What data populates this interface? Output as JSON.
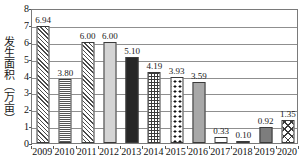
{
  "chart_data": {
    "type": "bar",
    "title": "",
    "xlabel": "",
    "ylabel": "发生面积（万亩）",
    "categories": [
      "2009",
      "2010",
      "2011",
      "2012",
      "2013",
      "2014",
      "2015",
      "2016",
      "2017",
      "2018",
      "2019",
      "2020"
    ],
    "values": [
      6.94,
      3.8,
      6.0,
      6.0,
      5.1,
      4.19,
      3.93,
      3.59,
      0.33,
      0.1,
      0.92,
      1.35
    ],
    "data_labels": [
      "6.94",
      "3.80",
      "6.00",
      "6.00",
      "5.10",
      "4.19",
      "3.93",
      "3.59",
      "0.33",
      "0.10",
      "0.92",
      "1.35"
    ],
    "bar_fills": [
      "diagonal-hatch",
      "horizontal-lines",
      "diagonal-hatch",
      "light-gray-solid",
      "black-solid",
      "fine-grid",
      "polka-dots",
      "mid-gray-solid",
      "white-empty",
      "black-solid",
      "dark-gray-solid",
      "cross-hatch-diamond"
    ],
    "ylim": [
      0,
      8
    ],
    "yticks": [
      "0",
      "1",
      "2",
      "3",
      "4",
      "5",
      "6",
      "7",
      "8"
    ],
    "ytick_values": [
      0,
      1,
      2,
      3,
      4,
      5,
      6,
      7,
      8
    ],
    "grid": "horizontal",
    "legend": "none",
    "colors": {
      "axis": "#7a7a7a",
      "gridline": "#8f8f8f",
      "text": "#111111",
      "bar_outline": "#3a3a3a",
      "light_gray": "#d4d4d4",
      "mid_gray": "#a8a8a8",
      "dark_gray": "#7d7d7d",
      "black": "#272727"
    }
  }
}
